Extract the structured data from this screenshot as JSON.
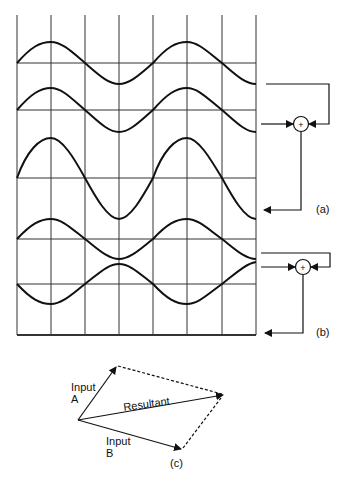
{
  "figure": {
    "panels": [
      {
        "id": "a",
        "label": "(a)",
        "description": "Two in-phase sine waves summed produce a larger-amplitude wave"
      },
      {
        "id": "b",
        "label": "(b)",
        "description": "Two anti-phase sine waves summed cancel to a flat line"
      },
      {
        "id": "c",
        "label": "(c)",
        "description": "Vector addition of two inputs giving a resultant"
      }
    ],
    "summer_symbol": "+",
    "vector_labels": {
      "input_a_line1": "Input",
      "input_a_line2": "A",
      "input_b_line1": "Input",
      "input_b_line2": "B",
      "resultant": "Resultant"
    },
    "colors": {
      "stroke": "#111111",
      "grid": "#333333",
      "background": "#ffffff"
    }
  }
}
